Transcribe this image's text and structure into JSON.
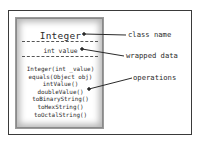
{
  "diagram": {
    "type": "uml-class",
    "class_box": {
      "class_name": "Integer",
      "attributes": [
        "int value"
      ],
      "operations": [
        "Integer(int _value)",
        "equals(Object obj)",
        "intValue()",
        "doubleValue()",
        "toBinaryString()",
        "toHexString()",
        "toOctalString()"
      ]
    },
    "annotations": [
      {
        "label": "class name",
        "points_to": "class_name"
      },
      {
        "label": "wrapped data",
        "points_to": "attributes"
      },
      {
        "label": "operations",
        "points_to": "operations"
      }
    ],
    "colors": {
      "frame": "#3a3a3a",
      "text": "#2a2a2a",
      "box_shadow": "#b8b8b8"
    }
  }
}
